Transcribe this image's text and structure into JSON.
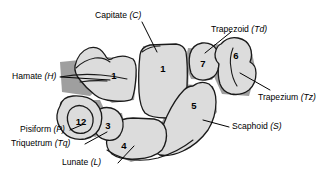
{
  "figure": {
    "background_color": "#ffffff",
    "bone_fill_color": "#dcdcdc",
    "bone_outline_color": "#1a1a1a",
    "shadow_color": "#8e8e8e"
  },
  "labels": {
    "capitate": {
      "name": "Capitate",
      "abbr": "(C)"
    },
    "trapezoid": {
      "name": "Trapezoid",
      "abbr": "(Td)"
    },
    "hamate": {
      "name": "Hamate",
      "abbr": "(H)"
    },
    "trapezium": {
      "name": "Trapezium",
      "abbr": "(Tz)"
    },
    "scaphoid": {
      "name": "Scaphoid",
      "abbr": "(S)"
    },
    "pisiform": {
      "name": "Pisiform",
      "abbr": "(P)"
    },
    "triquetrum": {
      "name": "Triquetrum",
      "abbr": "(Tq)"
    },
    "lunate": {
      "name": "Lunate",
      "abbr": "(L)"
    }
  },
  "bone_numbers": {
    "hamate": "1",
    "capitate": "1",
    "trapezoid": "7",
    "trapezium": "6",
    "scaphoid": "5",
    "lunate": "4",
    "triquetrum": "3",
    "pisiform": "12"
  }
}
